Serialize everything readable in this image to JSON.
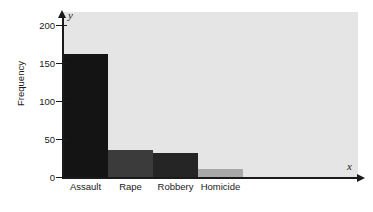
{
  "chart_data": {
    "type": "bar",
    "title": "",
    "xlabel": "",
    "ylabel": "Frequency",
    "categories": [
      "Assault",
      "Rape",
      "Robbery",
      "Homicide"
    ],
    "values": [
      162,
      35,
      31,
      11
    ],
    "bar_colors": [
      "#141414",
      "#3b3b3b",
      "#252525",
      "#a9a9a9"
    ],
    "ylim": [
      0,
      215
    ],
    "y_ticks": [
      0,
      50,
      100,
      150,
      200
    ],
    "y_tick_labels": [
      "0",
      "50",
      "100",
      "150",
      "200"
    ],
    "grid": false,
    "legend": null,
    "axis_end_labels": {
      "x": "x",
      "y": "y"
    },
    "plot_background": "#e5e5e5",
    "axis_color": "#1a1a1a"
  }
}
